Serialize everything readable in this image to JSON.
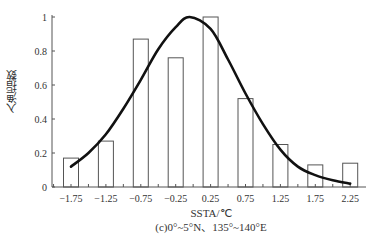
{
  "chart_data": {
    "type": "bar",
    "title": "",
    "caption": "(c)0°~5°N、135°~140°E",
    "xlabel": "SSTA/℃",
    "ylabel": "入渔指数",
    "categories": [
      "-1.75",
      "-1.25",
      "-0.75",
      "-0.25",
      "0.25",
      "0.75",
      "1.25",
      "1.75",
      "2.25"
    ],
    "values": [
      0.17,
      0.27,
      0.87,
      0.76,
      1.0,
      0.52,
      0.25,
      0.13,
      0.14
    ],
    "yticks": [
      "0",
      "0.2",
      "0.4",
      "0.6",
      "0.8",
      "1"
    ],
    "ylim": [
      0,
      1
    ],
    "grid": false,
    "legend": null,
    "fitted_curve": {
      "type": "line",
      "description": "smoothed fit curve over bars",
      "x": [
        -1.75,
        -1.5,
        -1.25,
        -1.0,
        -0.75,
        -0.5,
        -0.25,
        -0.05,
        0.25,
        0.5,
        0.75,
        1.0,
        1.25,
        1.5,
        1.75,
        2.0,
        2.25
      ],
      "y": [
        0.12,
        0.2,
        0.31,
        0.46,
        0.63,
        0.81,
        0.94,
        1.0,
        0.93,
        0.75,
        0.55,
        0.37,
        0.22,
        0.12,
        0.07,
        0.04,
        0.02
      ]
    }
  },
  "axis": {
    "xlabel": "SSTA/℃",
    "ylabel": "入渔指数",
    "caption": "(c)0°~5°N、135°~140°E"
  }
}
